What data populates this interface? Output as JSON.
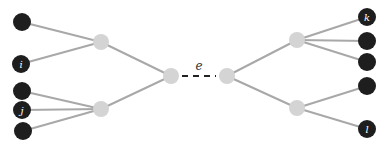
{
  "diagram": {
    "type": "tree-edge-split",
    "colors": {
      "leaf": "#1e1e1e",
      "inner": "#d4d4d4",
      "edge": "#a8a8a8",
      "central_edge": "#222222"
    },
    "central_edge_label": "e",
    "nodes": [
      {
        "id": "L1",
        "kind": "leaf",
        "x": 22,
        "y": 22,
        "r": 9,
        "label": ""
      },
      {
        "id": "Li",
        "kind": "leaf",
        "x": 21,
        "y": 64,
        "r": 9,
        "label": "i"
      },
      {
        "id": "L3",
        "kind": "leaf",
        "x": 22,
        "y": 91,
        "r": 9,
        "label": ""
      },
      {
        "id": "Lj",
        "kind": "leaf",
        "x": 22,
        "y": 110,
        "r": 9,
        "label": "j"
      },
      {
        "id": "L5",
        "kind": "leaf",
        "x": 23,
        "y": 131,
        "r": 9,
        "label": ""
      },
      {
        "id": "A",
        "kind": "inner",
        "x": 101,
        "y": 42,
        "r": 8,
        "label": ""
      },
      {
        "id": "B",
        "kind": "inner",
        "x": 101,
        "y": 109,
        "r": 8,
        "label": ""
      },
      {
        "id": "C",
        "kind": "inner",
        "x": 171,
        "y": 76,
        "r": 8,
        "label": ""
      },
      {
        "id": "D",
        "kind": "inner",
        "x": 227,
        "y": 76,
        "r": 8,
        "label": ""
      },
      {
        "id": "E",
        "kind": "inner",
        "x": 297,
        "y": 40,
        "r": 8,
        "label": ""
      },
      {
        "id": "F",
        "kind": "inner",
        "x": 297,
        "y": 108,
        "r": 8,
        "label": ""
      },
      {
        "id": "Rk",
        "kind": "leaf",
        "x": 367,
        "y": 17,
        "r": 9,
        "label": "k"
      },
      {
        "id": "R2",
        "kind": "leaf",
        "x": 367,
        "y": 41,
        "r": 9,
        "label": ""
      },
      {
        "id": "R3",
        "kind": "leaf",
        "x": 367,
        "y": 62,
        "r": 9,
        "label": ""
      },
      {
        "id": "R4",
        "kind": "leaf",
        "x": 367,
        "y": 86,
        "r": 9,
        "label": ""
      },
      {
        "id": "Rl",
        "kind": "leaf",
        "x": 367,
        "y": 129,
        "r": 9,
        "label": "l"
      }
    ],
    "edges": [
      [
        "L1",
        "A"
      ],
      [
        "Li",
        "A"
      ],
      [
        "L3",
        "B"
      ],
      [
        "Lj",
        "B"
      ],
      [
        "L5",
        "B"
      ],
      [
        "A",
        "C"
      ],
      [
        "B",
        "C"
      ],
      [
        "D",
        "E"
      ],
      [
        "D",
        "F"
      ],
      [
        "E",
        "Rk"
      ],
      [
        "E",
        "R2"
      ],
      [
        "E",
        "R3"
      ],
      [
        "F",
        "R4"
      ],
      [
        "F",
        "Rl"
      ]
    ],
    "central_edge": [
      "C",
      "D"
    ]
  }
}
